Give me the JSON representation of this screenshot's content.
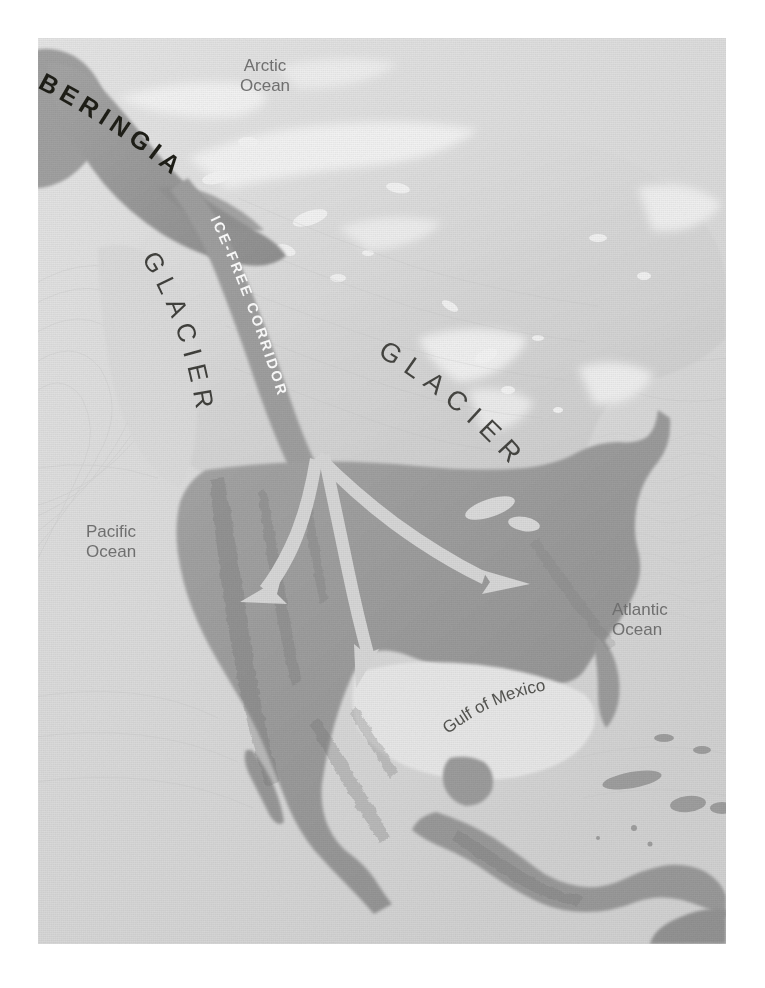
{
  "figure": {
    "type": "map",
    "projection_note": "shaded-relief grayscale map with white page margin"
  },
  "palette": {
    "page_background": "#ffffff",
    "ocean": "#e0e0e0",
    "deep_ocean_shade": "#cfcfcf",
    "ice_sheet": "#d8d8d8",
    "ice_highlight": "#f2f2f2",
    "exposed_land": "#9b9b9b",
    "land_shadow": "#8a8a8a",
    "corridor_band": "#9a9a9a",
    "arrow": "#d6d6d6",
    "label_dark": "#3a3a36",
    "label_gray": "#6f6f6f",
    "label_white": "#ffffff"
  },
  "labels": {
    "arctic_ocean": {
      "line1": "Arctic",
      "line2": "Ocean"
    },
    "pacific_ocean": {
      "line1": "Pacific",
      "line2": "Ocean"
    },
    "atlantic_ocean": {
      "line1": "Atlantic",
      "line2": "Ocean"
    },
    "gulf_of_mexico": "Gulf of Mexico",
    "beringia": "BERINGIA",
    "glacier_west": "GLACIER",
    "glacier_east": "GLACIER",
    "ice_free_corridor": "ICE-FREE CORRIDOR"
  },
  "map_features": [
    {
      "name": "beringia-land-bridge",
      "kind": "exposed-land",
      "label": "BERINGIA"
    },
    {
      "name": "cordilleran-ice-sheet",
      "kind": "ice-sheet",
      "label": "GLACIER"
    },
    {
      "name": "laurentide-ice-sheet",
      "kind": "ice-sheet",
      "label": "GLACIER"
    },
    {
      "name": "ice-free-corridor",
      "kind": "corridor",
      "label": "ICE-FREE CORRIDOR"
    },
    {
      "name": "north-american-landmass",
      "kind": "exposed-land",
      "label": ""
    }
  ],
  "migration_arrows": [
    {
      "name": "arrow-southwest-coastal",
      "from": "ice-free-corridor exit",
      "to": "Great Basin / southwest"
    },
    {
      "name": "arrow-south-interior",
      "from": "ice-free-corridor exit",
      "to": "central plains / Mexico"
    },
    {
      "name": "arrow-southeast",
      "from": "ice-free-corridor exit",
      "to": "eastern woodlands / Atlantic seaboard"
    }
  ]
}
